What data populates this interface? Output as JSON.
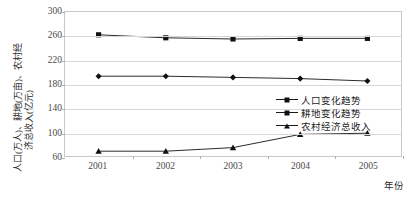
{
  "chart_data": {
    "type": "line",
    "title": "",
    "xlabel": "年份",
    "ylabel": "人口(万人)、耕地(万亩)、农村经济总收入(亿元)",
    "ylabel_col1": "人口(万人)、耕地(万亩)、农村经",
    "ylabel_col2": "济总收入(亿元)",
    "categories": [
      "2001",
      "2002",
      "2003",
      "2004",
      "2005"
    ],
    "x": [
      2001,
      2002,
      2003,
      2004,
      2005
    ],
    "ylim": [
      60,
      300
    ],
    "yticks": [
      300,
      260,
      220,
      180,
      140,
      100,
      60
    ],
    "ytick_labels": [
      "300",
      "260",
      "220",
      "180",
      "140",
      "100",
      "60"
    ],
    "grid": true,
    "legend_position": "center-right",
    "series": [
      {
        "name": "人口变化趋势",
        "marker": "diamond",
        "color": "#111111",
        "values": [
          193,
          193,
          191,
          189,
          185
        ]
      },
      {
        "name": "耕地变化趋势",
        "marker": "square",
        "color": "#111111",
        "values": [
          262,
          257,
          255,
          256,
          256
        ]
      },
      {
        "name": "农村经济总收入",
        "marker": "triangle",
        "color": "#111111",
        "values": [
          68,
          68,
          74,
          96,
          98
        ]
      }
    ]
  },
  "legend": {
    "entries": [
      {
        "label": "人口变化趋势",
        "marker": "diamond-marker-icon"
      },
      {
        "label": "耕地变化趋势",
        "marker": "square-marker-icon"
      },
      {
        "label": "农村经济总收入",
        "marker": "triangle-marker-icon"
      }
    ]
  },
  "axes": {
    "x_title": "年份",
    "y_title_line1": "人口(万人)、耕地(万亩)、农村经",
    "y_title_line2": "济总收入(亿元)"
  },
  "colors": {
    "series": "#111111",
    "grid": "#d7d7d7",
    "frame": "#c8c8c8",
    "tick_text": "#4a4a4a",
    "background": "#ffffff"
  }
}
